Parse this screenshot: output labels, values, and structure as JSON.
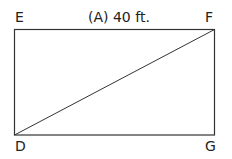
{
  "diagram": {
    "type": "rectangle-with-diagonal",
    "vertices": {
      "E": {
        "label": "E",
        "position": "top-left"
      },
      "F": {
        "label": "F",
        "position": "top-right"
      },
      "D": {
        "label": "D",
        "position": "bottom-left"
      },
      "G": {
        "label": "G",
        "position": "bottom-right"
      }
    },
    "top_side_label": "(A) 40 ft.",
    "diagonal": "D-F",
    "stroke_color": "#333333"
  }
}
